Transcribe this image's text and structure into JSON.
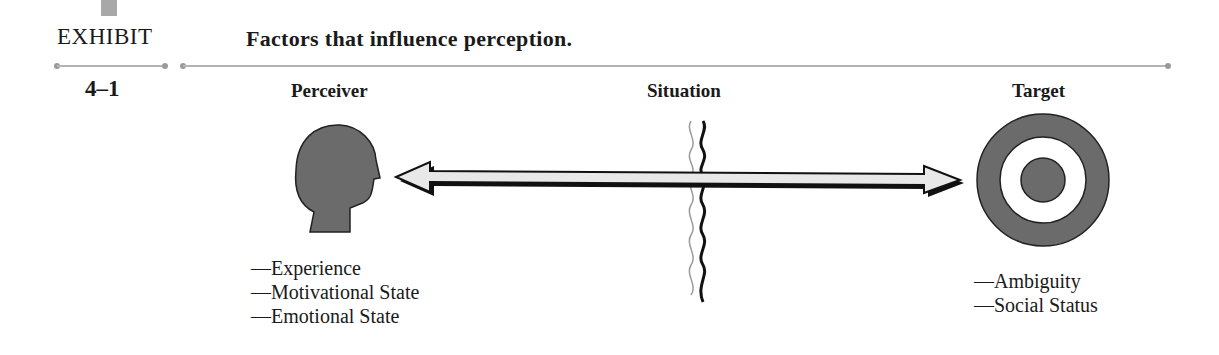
{
  "exhibit": {
    "label": "EXHIBIT",
    "number": "4–1",
    "title": "Factors that influence perception."
  },
  "diagram": {
    "columns": [
      {
        "id": "perceiver",
        "heading": "Perceiver",
        "icon": "head-profile-icon",
        "factors": [
          "—Experience",
          "—Motivational State",
          "—Emotional State"
        ]
      },
      {
        "id": "situation",
        "heading": "Situation",
        "icon": "wavy-lines-icon",
        "factors": []
      },
      {
        "id": "target",
        "heading": "Target",
        "icon": "bullseye-target-icon",
        "factors": [
          "—Ambiguity",
          "—Social Status"
        ]
      }
    ],
    "connector": "double-headed-arrow",
    "colors": {
      "shape_fill": "#6b6b6b",
      "arrow_fill": "#e8e8e8",
      "arrow_outline": "#111111",
      "rule": "#b4b4b4",
      "marker": "#a8a8a8"
    }
  }
}
